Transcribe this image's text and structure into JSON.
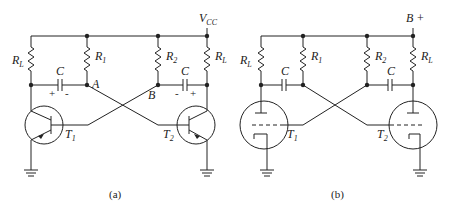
{
  "figure": {
    "panel_a": {
      "caption": "(a)",
      "supply_label": "V",
      "supply_sub": "CC",
      "resistors": [
        {
          "name": "R",
          "sub": "L"
        },
        {
          "name": "R",
          "sub": "1"
        },
        {
          "name": "R",
          "sub": "2"
        },
        {
          "name": "R",
          "sub": "L"
        }
      ],
      "capacitors": [
        {
          "name": "C",
          "left_sign": "+",
          "right_sign": "-"
        },
        {
          "name": "C",
          "left_sign": "-",
          "right_sign": "+"
        }
      ],
      "nodes": {
        "a": "A",
        "b": "B"
      },
      "transistors": [
        {
          "name": "T",
          "sub": "1"
        },
        {
          "name": "T",
          "sub": "2"
        }
      ]
    },
    "panel_b": {
      "caption": "(b)",
      "supply_label": "B +",
      "resistors": [
        {
          "name": "R",
          "sub": "L"
        },
        {
          "name": "R",
          "sub": "1"
        },
        {
          "name": "R",
          "sub": "2"
        },
        {
          "name": "R",
          "sub": "L"
        }
      ],
      "capacitors": [
        {
          "name": "C"
        },
        {
          "name": "C"
        }
      ],
      "tubes": [
        {
          "name": "T",
          "sub": "1"
        },
        {
          "name": "T",
          "sub": "2"
        }
      ]
    }
  }
}
